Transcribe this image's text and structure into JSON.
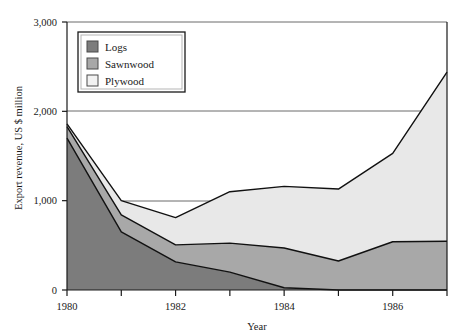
{
  "chart_data": {
    "type": "area",
    "stacked": true,
    "title": "",
    "xlabel": "Year",
    "ylabel": "Export revenue, US $ million",
    "x": [
      1980,
      1981,
      1982,
      1983,
      1984,
      1985,
      1986,
      1987
    ],
    "xlim": [
      1980,
      1987
    ],
    "ylim": [
      0,
      3000
    ],
    "yticks": [
      0,
      1000,
      2000,
      3000
    ],
    "ytick_labels": [
      "0",
      "1,000",
      "2,000",
      "3,000"
    ],
    "xticks": [
      1980,
      1982,
      1984,
      1986
    ],
    "xtick_labels": [
      "1980",
      "1982",
      "1984",
      "1986"
    ],
    "grid": "horizontal-at-yticks",
    "legend_position": "top-left-inside",
    "series": [
      {
        "name": "Logs",
        "color": "#7c7c7c",
        "values": [
          1700,
          650,
          315,
          200,
          25,
          0,
          0,
          0
        ]
      },
      {
        "name": "Sawnwood",
        "color": "#a8a8a8",
        "values": [
          130,
          190,
          190,
          325,
          445,
          325,
          540,
          545
        ]
      },
      {
        "name": "Plywood",
        "color": "#e8e8e8",
        "values": [
          30,
          160,
          305,
          575,
          690,
          805,
          990,
          1895
        ]
      }
    ],
    "cumulative_tops": {
      "logs": [
        1700,
        650,
        315,
        200,
        25,
        0,
        0,
        0
      ],
      "sawnwood": [
        1830,
        840,
        505,
        525,
        470,
        325,
        540,
        545
      ],
      "plywood": [
        1860,
        1000,
        810,
        1100,
        1160,
        1130,
        1530,
        2440
      ]
    },
    "legend": [
      {
        "label": "Logs",
        "swatch": "#7c7c7c"
      },
      {
        "label": "Sawnwood",
        "swatch": "#a8a8a8"
      },
      {
        "label": "Plywood",
        "swatch": "#f2f2f2"
      }
    ]
  },
  "axis": {
    "y_title": "Export revenue, US $ million",
    "x_title": "Year"
  }
}
